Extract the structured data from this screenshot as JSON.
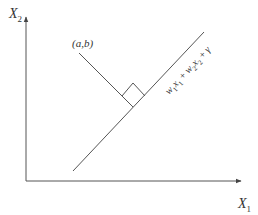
{
  "diagram": {
    "type": "hyperplane-projection",
    "axes": {
      "x_label": "X",
      "x_sub": "1",
      "y_label": "X",
      "y_sub": "2"
    },
    "point_label": "(a,b)",
    "line_equation": {
      "w1": "w",
      "w1_sub": "1",
      "x1": "x",
      "x1_sub": "1",
      "plus1": " + ",
      "w2": "w",
      "w2_sub": "2",
      "x2": "x",
      "x2_sub": "2",
      "plus2": " + ",
      "gamma": "γ"
    },
    "colors": {
      "stroke": "#555555",
      "text": "#333333",
      "background": "#ffffff"
    }
  }
}
